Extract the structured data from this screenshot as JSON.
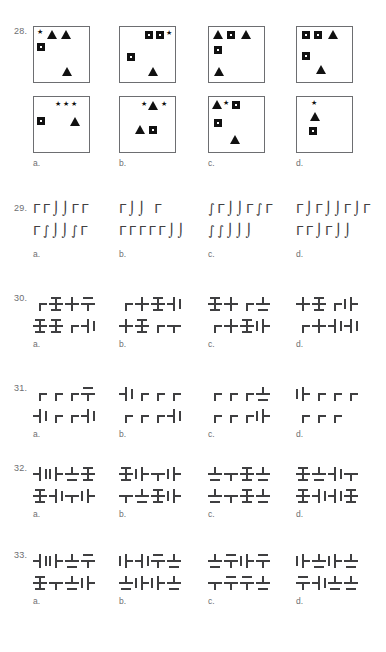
{
  "page": {
    "width": 386,
    "height": 652,
    "background": "#ffffff",
    "ink": "#414042",
    "label_color": "#6d6e71"
  },
  "option_labels": [
    "a.",
    "b.",
    "c.",
    "d."
  ],
  "questions": [
    {
      "number": "28.",
      "type": "shape-panels",
      "top": 26,
      "panels": [
        {
          "option": "a.",
          "shapes": [
            {
              "kind": "star",
              "x": 3,
              "y": 2
            },
            {
              "kind": "triangle",
              "x": 13,
              "y": 3
            },
            {
              "kind": "triangle",
              "x": 27,
              "y": 3
            },
            {
              "kind": "square",
              "x": 3,
              "y": 16
            },
            {
              "kind": "triangle",
              "x": 28,
              "y": 40
            }
          ]
        },
        {
          "option": "b.",
          "shapes": [
            {
              "kind": "square",
              "x": 25,
              "y": 4
            },
            {
              "kind": "square",
              "x": 36,
              "y": 4
            },
            {
              "kind": "star",
              "x": 46,
              "y": 3
            },
            {
              "kind": "square",
              "x": 7,
              "y": 26
            },
            {
              "kind": "triangle",
              "x": 28,
              "y": 40
            }
          ]
        },
        {
          "option": "c.",
          "shapes": [
            {
              "kind": "triangle",
              "x": 4,
              "y": 3
            },
            {
              "kind": "square",
              "x": 18,
              "y": 4
            },
            {
              "kind": "triangle",
              "x": 32,
              "y": 3
            },
            {
              "kind": "square",
              "x": 5,
              "y": 19
            },
            {
              "kind": "triangle",
              "x": 5,
              "y": 40
            }
          ]
        },
        {
          "option": "d.",
          "shapes": [
            {
              "kind": "square",
              "x": 5,
              "y": 4
            },
            {
              "kind": "square",
              "x": 17,
              "y": 4
            },
            {
              "kind": "triangle",
              "x": 31,
              "y": 3
            },
            {
              "kind": "square",
              "x": 5,
              "y": 25
            },
            {
              "kind": "triangle",
              "x": 19,
              "y": 38
            }
          ]
        }
      ],
      "answer_panels": [
        {
          "option": "a.",
          "shapes": [
            {
              "kind": "star",
              "x": 21,
              "y": 4
            },
            {
              "kind": "star",
              "x": 29,
              "y": 4
            },
            {
              "kind": "star",
              "x": 37,
              "y": 4
            },
            {
              "kind": "square",
              "x": 3,
              "y": 20
            },
            {
              "kind": "triangle",
              "x": 36,
              "y": 20
            }
          ]
        },
        {
          "option": "b.",
          "shapes": [
            {
              "kind": "star",
              "x": 21,
              "y": 4
            },
            {
              "kind": "triangle",
              "x": 28,
              "y": 4
            },
            {
              "kind": "star",
              "x": 41,
              "y": 4
            },
            {
              "kind": "triangle",
              "x": 15,
              "y": 28
            },
            {
              "kind": "square",
              "x": 29,
              "y": 29
            }
          ]
        },
        {
          "option": "c.",
          "shapes": [
            {
              "kind": "triangle",
              "x": 3,
              "y": 3
            },
            {
              "kind": "star",
              "x": 14,
              "y": 3
            },
            {
              "kind": "square",
              "x": 23,
              "y": 4
            },
            {
              "kind": "square",
              "x": 5,
              "y": 22
            },
            {
              "kind": "triangle",
              "x": 21,
              "y": 38
            }
          ]
        },
        {
          "option": "d.",
          "shapes": [
            {
              "kind": "star",
              "x": 14,
              "y": 3
            },
            {
              "kind": "triangle",
              "x": 13,
              "y": 15
            },
            {
              "kind": "square",
              "x": 12,
              "y": 30
            }
          ]
        }
      ]
    },
    {
      "number": "29.",
      "type": "glyph-rows",
      "top": 203,
      "columns": [
        {
          "option": "a.",
          "row1": "ΓΓ⌡⌡ΓΓ",
          "row2": "Γ∫⌡⌡∫Γ"
        },
        {
          "option": "b.",
          "row1": "Γ⌡⌡ Γ",
          "row2": "ΓΓΓΓΓ⌡⌡"
        },
        {
          "option": "c.",
          "row1": "∫Γ⌡⌡Γ∫Γ",
          "row2": "∫∫⌡⌡⌡"
        },
        {
          "option": "d.",
          "row1": "Γ⌡Γ⌡⌡Γ⌡Γ",
          "row2": "ΓΓ⌡Γ⌡⌡"
        }
      ]
    },
    {
      "number": "30.",
      "type": "cross-rows",
      "top": 293,
      "columns": [
        {
          "option": "a.",
          "row1": [
            "corner-tr",
            "cross-tb",
            "cross-plain",
            "tee-down-tick"
          ],
          "row2": [
            "cross-tb",
            "cross-tb",
            "corner-tr",
            "tee-left-tick"
          ]
        },
        {
          "option": "b.",
          "row1": [
            "corner-tr",
            "cross-plain",
            "cross-tb",
            "tee-left-tick"
          ],
          "row2": [
            "cross-plain",
            "cross-tb",
            "corner-tr",
            "tee-down"
          ]
        },
        {
          "option": "c.",
          "row1": [
            "cross-tb",
            "cross-plain",
            "corner-tr",
            "tee-up-tick"
          ],
          "row2": [
            "corner-tr",
            "cross-plain",
            "cross-tb",
            "tee-right-tick"
          ]
        },
        {
          "option": "d.",
          "row1": [
            "cross-plain",
            "cross-tb",
            "corner-tr",
            "tee-right-tick"
          ],
          "row2": [
            "corner-tr",
            "cross-plain",
            "tee-left-tick",
            "tee-left-tick"
          ]
        }
      ]
    },
    {
      "number": "31.",
      "type": "cross-rows",
      "top": 383,
      "columns": [
        {
          "option": "a.",
          "row1": [
            "corner-tr",
            "corner-tr",
            "corner-tr",
            "tee-down-tick"
          ],
          "row2": [
            "tee-left-tick",
            "corner-tr",
            "corner-tr",
            "tee-left-tick"
          ]
        },
        {
          "option": "b.",
          "row1": [
            "tee-left-tick",
            "corner-tr",
            "corner-tr",
            "corner-tr"
          ],
          "row2": [
            "corner-tr",
            "corner-tr",
            "corner-tr",
            "tee-left-tick"
          ]
        },
        {
          "option": "c.",
          "row1": [
            "corner-tr",
            "corner-tr",
            "corner-tr",
            "tee-up-tick"
          ],
          "row2": [
            "corner-tr",
            "corner-tr",
            "corner-tr",
            "tee-right-tick"
          ]
        },
        {
          "option": "d.",
          "row1": [
            "tee-right-tick",
            "corner-tr",
            "corner-tr",
            "corner-tr"
          ],
          "row2": [
            "corner-tr",
            "corner-tr",
            "corner-tr"
          ]
        }
      ]
    },
    {
      "number": "32.",
      "type": "cross-rows",
      "top": 463,
      "columns": [
        {
          "option": "a.",
          "row1": [
            "tee-left-tick",
            "tee-right-tick",
            "tee-up-tick",
            "cross-tb"
          ],
          "row2": [
            "cross-tb",
            "tee-left-tick",
            "tee-down",
            "tee-right-tick"
          ]
        },
        {
          "option": "b.",
          "row1": [
            "cross-tb",
            "tee-right-tick",
            "tee-down",
            "tee-right-tick"
          ],
          "row2": [
            "tee-down",
            "tee-up-tick",
            "cross-tb",
            "tee-right-tick"
          ]
        },
        {
          "option": "c.",
          "row1": [
            "tee-up-tick",
            "tee-down",
            "cross-tb",
            "tee-up-tick"
          ],
          "row2": [
            "tee-up-tick",
            "tee-down",
            "cross-tb",
            "tee-up-bar"
          ]
        },
        {
          "option": "d.",
          "row1": [
            "cross-tb",
            "tee-up-bar",
            "tee-left-tick",
            "tee-down"
          ],
          "row2": [
            "cross-tb",
            "tee-left-tick",
            "tee-left-tick",
            "cross-tb"
          ]
        }
      ]
    },
    {
      "number": "33.",
      "type": "cross-rows",
      "top": 550,
      "columns": [
        {
          "option": "a.",
          "row1": [
            "tee-left-tick",
            "tee-right-tick",
            "tee-up-tick",
            "tee-down-tick"
          ],
          "row2": [
            "cross-tb",
            "tee-down",
            "tee-up-tick",
            "tee-right-tick"
          ]
        },
        {
          "option": "b.",
          "row1": [
            "tee-right-tick",
            "tee-left-tick",
            "tee-down-tick",
            "tee-up-tick"
          ],
          "row2": [
            "tee-up-tick",
            "tee-right-tick",
            "tee-right-tick",
            "tee-up-tick"
          ]
        },
        {
          "option": "c.",
          "row1": [
            "tee-up-tick",
            "tee-down-tick",
            "tee-right-tick",
            "tee-down-tick"
          ],
          "row2": [
            "tee-down",
            "tee-down-tick",
            "tee-down-tick",
            "tee-up-tick"
          ]
        },
        {
          "option": "d.",
          "row1": [
            "tee-right-tick",
            "tee-up-tick",
            "tee-right-tick",
            "tee-up-tick"
          ],
          "row2": [
            "tee-down-tick",
            "tee-left-tick",
            "tee-up-tick",
            "tee-up-tick"
          ]
        }
      ]
    }
  ]
}
